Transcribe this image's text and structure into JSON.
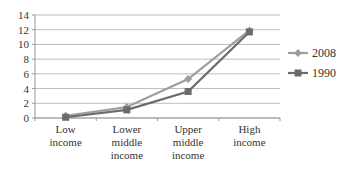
{
  "chart_data": {
    "type": "line",
    "title": "",
    "xlabel": "",
    "ylabel": "",
    "categories": [
      [
        "Low",
        "income"
      ],
      [
        "Lower",
        "middle",
        "income"
      ],
      [
        "Upper",
        "middle",
        "income"
      ],
      [
        "High",
        "income"
      ]
    ],
    "series": [
      {
        "name": "2008",
        "values": [
          0.3,
          1.5,
          5.3,
          11.9
        ],
        "color": "#9e9e9e",
        "marker": "diamond"
      },
      {
        "name": "1990",
        "values": [
          0.1,
          1.1,
          3.6,
          11.7
        ],
        "color": "#6b6b6b",
        "marker": "square"
      }
    ],
    "ylim": [
      0,
      14
    ],
    "yticks": [
      0,
      2,
      4,
      6,
      8,
      10,
      12,
      14
    ],
    "grid": true,
    "legend_position": "right"
  }
}
